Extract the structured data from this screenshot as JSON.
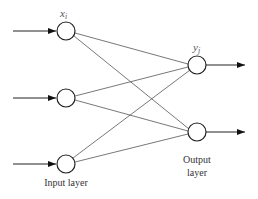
{
  "diagram": {
    "colors": {
      "stroke": "#222222",
      "edge": "#555555",
      "text": "#333333",
      "background": "#ffffff"
    },
    "input_layer": {
      "label": "Input layer",
      "node_label": "x",
      "node_label_sub": "i",
      "nodes": [
        {
          "id": "in1",
          "cx": 66,
          "cy": 31
        },
        {
          "id": "in2",
          "cx": 66,
          "cy": 98
        },
        {
          "id": "in3",
          "cx": 66,
          "cy": 164
        }
      ]
    },
    "output_layer": {
      "label_line1": "Output",
      "label_line2": "layer",
      "node_label": "y",
      "node_label_sub": "j",
      "nodes": [
        {
          "id": "out1",
          "cx": 197,
          "cy": 65
        },
        {
          "id": "out2",
          "cx": 197,
          "cy": 132
        }
      ]
    },
    "node_radius": 9,
    "connections": "fully-connected",
    "input_arrows": 3,
    "output_arrows": 2
  }
}
